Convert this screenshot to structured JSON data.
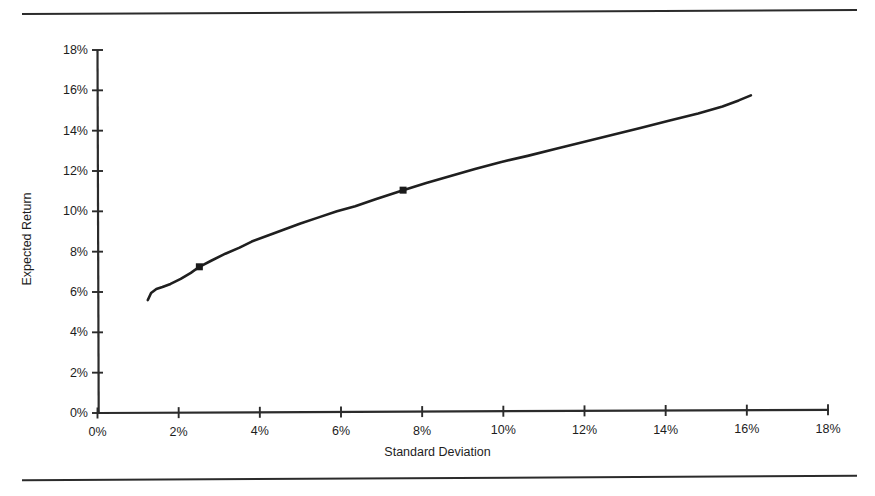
{
  "chart_data": {
    "type": "line",
    "title": "",
    "subtitle": "",
    "xlabel": "Standard Deviation",
    "ylabel": "Expected Return",
    "xlim": [
      0,
      18
    ],
    "ylim": [
      0,
      18
    ],
    "xticks": [
      "0%",
      "2%",
      "4%",
      "6%",
      "8%",
      "10%",
      "12%",
      "14%",
      "16%",
      "18%"
    ],
    "xtick_values": [
      0,
      2,
      4,
      6,
      8,
      10,
      12,
      14,
      16,
      18
    ],
    "yticks": [
      "0%",
      "2%",
      "4%",
      "6%",
      "8%",
      "10%",
      "12%",
      "14%",
      "16%",
      "18%"
    ],
    "ytick_values": [
      0,
      2,
      4,
      6,
      8,
      10,
      12,
      14,
      16,
      18
    ],
    "grid": false,
    "legend": null,
    "legend_position": "none",
    "series": [
      {
        "name": "Efficient Frontier",
        "line_color": "#1f1f1f",
        "line_width": 2.6,
        "x": [
          1.24,
          1.32,
          1.45,
          1.6,
          1.8,
          2.05,
          2.3,
          2.51,
          2.8,
          3.15,
          3.5,
          3.8,
          4.2,
          4.6,
          5.0,
          5.45,
          5.9,
          6.35,
          6.85,
          7.53,
          8.1,
          8.7,
          9.3,
          9.95,
          10.6,
          11.3,
          12.0,
          12.7,
          13.4,
          14.1,
          14.8,
          15.4,
          15.8,
          16.1
        ],
        "y": [
          5.6,
          5.95,
          6.15,
          6.25,
          6.4,
          6.65,
          6.95,
          7.25,
          7.55,
          7.9,
          8.2,
          8.5,
          8.8,
          9.1,
          9.4,
          9.7,
          10.0,
          10.25,
          10.6,
          11.05,
          11.4,
          11.75,
          12.1,
          12.45,
          12.75,
          13.1,
          13.45,
          13.8,
          14.15,
          14.5,
          14.85,
          15.2,
          15.5,
          15.75
        ]
      }
    ],
    "markers": [
      {
        "name": "portfolio-marker-1",
        "x": 2.51,
        "y": 7.25,
        "shape": "square",
        "color": "#1a1a1a",
        "size": 7
      },
      {
        "name": "portfolio-marker-2",
        "x": 7.53,
        "y": 11.05,
        "shape": "square",
        "color": "#1a1a1a",
        "size": 7
      }
    ],
    "axis_color": "#2b2b2b",
    "background": "#ffffff"
  },
  "decorations": {
    "top_rule": "horizontal-rule",
    "bottom_rule": "horizontal-rule"
  }
}
